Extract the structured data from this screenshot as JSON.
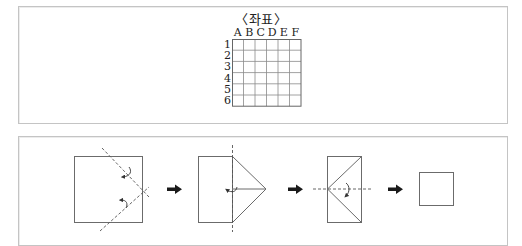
{
  "coordinate_panel": {
    "title": "〈좌표〉",
    "columns": [
      "A",
      "B",
      "C",
      "D",
      "E",
      "F"
    ],
    "rows": [
      "1",
      "2",
      "3",
      "4",
      "5",
      "6"
    ],
    "grid": {
      "cols": 6,
      "rows": 6,
      "cell_width": 11.5,
      "cell_height": 11.2,
      "line_color": "#8a8a8a",
      "border_color": "#666666"
    }
  },
  "folding_panel": {
    "steps": [
      {
        "step": 1,
        "shape": "square",
        "description": "square with two dashed diagonal fold lines and two curved fold arrows on the right side"
      },
      {
        "step": 2,
        "shape": "rectangle-with-triangle",
        "description": "rectangle with triangular flap to the right, vertical dashed fold line, curved fold arrow"
      },
      {
        "step": 3,
        "shape": "rectangle-with-diagonals",
        "description": "rectangle with two diagonals meeting at left midpoint, horizontal dashed fold line, curved fold arrow"
      },
      {
        "step": 4,
        "shape": "small-square",
        "description": "final small square"
      }
    ],
    "arrows": [
      "right-arrow",
      "right-arrow",
      "right-arrow"
    ],
    "colors": {
      "stroke": "#6b6b6b",
      "arrow": "#1a1a1a",
      "frame": "#c4c4c4"
    }
  }
}
